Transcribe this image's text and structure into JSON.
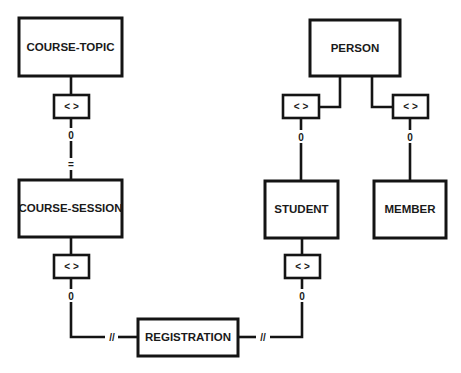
{
  "diagram": {
    "type": "entity-relationship",
    "entities": {
      "course_topic": "COURSE-TOPIC",
      "course_session": "COURSE-SESSION",
      "registration": "REGISTRATION",
      "person": "PERSON",
      "student": "STUDENT",
      "member": "MEMBER"
    },
    "relationship_symbol": "< >",
    "markers": {
      "optional": "0",
      "exclusive": "=",
      "many": "//"
    },
    "connections": [
      {
        "from": "COURSE-TOPIC",
        "to": "COURSE-SESSION",
        "via": "< >",
        "markers": [
          "0",
          "="
        ]
      },
      {
        "from": "COURSE-SESSION",
        "to": "REGISTRATION",
        "via": "< >",
        "markers": [
          "0",
          "//"
        ]
      },
      {
        "from": "PERSON",
        "to": "STUDENT",
        "via": "< >",
        "markers": [
          "0"
        ]
      },
      {
        "from": "PERSON",
        "to": "MEMBER",
        "via": "< >",
        "markers": [
          "0"
        ]
      },
      {
        "from": "STUDENT",
        "to": "REGISTRATION",
        "via": "< >",
        "markers": [
          "0",
          "//"
        ]
      }
    ]
  }
}
